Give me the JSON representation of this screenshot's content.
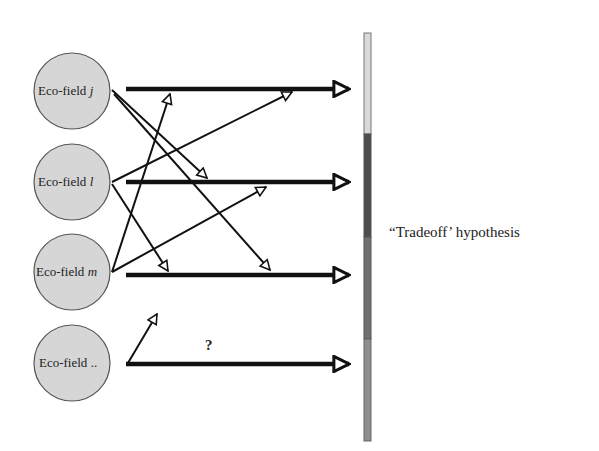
{
  "nodes": [
    {
      "id": "j",
      "label_prefix": "Eco-field ",
      "label_var": "j",
      "cx": 72,
      "cy": 91
    },
    {
      "id": "l",
      "label_prefix": "Eco-field ",
      "label_var": "l",
      "cx": 72,
      "cy": 182
    },
    {
      "id": "m",
      "label_prefix": "Eco-field ",
      "label_var": "m",
      "cx": 72,
      "cy": 270
    },
    {
      "id": "etc",
      "label_prefix": "Eco-field ",
      "label_var": "..",
      "cx": 72,
      "cy": 360
    }
  ],
  "unknown_label": "?",
  "hypothesis_label": "“Tradeoff’ hypothesis",
  "bar_segments": [
    {
      "name": "segment-1",
      "color": "#d9d9d9",
      "y0": 33,
      "y1": 134
    },
    {
      "name": "segment-2",
      "color": "#4d4d4d",
      "y0": 134,
      "y1": 237
    },
    {
      "name": "segment-3",
      "color": "#707070",
      "y0": 237,
      "y1": 339
    },
    {
      "name": "segment-4",
      "color": "#8e8e8e",
      "y0": 339,
      "y1": 441
    }
  ],
  "colors": {
    "node_fill": "#d6d6d6",
    "node_stroke": "#555555",
    "line": "#111111"
  }
}
